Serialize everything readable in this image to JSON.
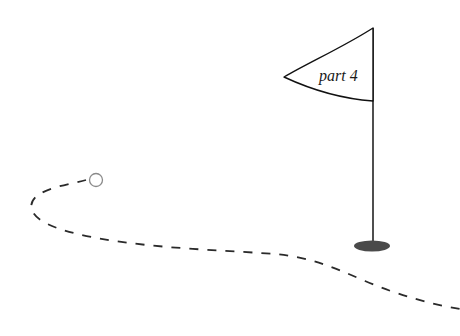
{
  "illustration": {
    "title": "Golf flag with dashed ball path",
    "background_color": "#ffffff"
  },
  "flag": {
    "label": "part 4",
    "label_color": "#1a1a1a",
    "banner_stroke": "#111111",
    "banner_fill": "#ffffff",
    "tip_x": 284,
    "tip_y": 77,
    "top_attach_x": 373,
    "top_attach_y": 28,
    "bottom_attach_x": 373,
    "bottom_attach_y": 101
  },
  "pole": {
    "color": "#3c3c3c",
    "top_x": 373,
    "top_y": 28,
    "bottom_x": 373,
    "bottom_y": 246,
    "width": 1.8
  },
  "base": {
    "color": "#4a4a4a",
    "center_x": 372,
    "center_y": 246,
    "radius_x": 18,
    "radius_y": 5.5
  },
  "ball": {
    "stroke_color": "#8a8a8a",
    "fill": "#ffffff",
    "center_x": 96,
    "center_y": 180,
    "radius": 6.5
  },
  "path": {
    "stroke_color": "#2a2a2a",
    "stroke_width": 1.8,
    "dash_pattern": "9 9",
    "start_x": 86,
    "start_y": 180,
    "end_x": 460,
    "end_y": 309,
    "description": "dashed trajectory looping left then sweeping right past the flag"
  }
}
